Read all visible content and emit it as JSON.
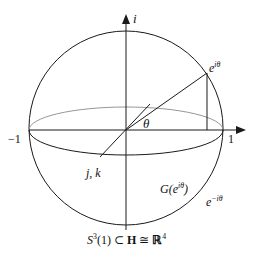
{
  "diagram": {
    "axes": {
      "vertical_label": "i",
      "left_label": "−1",
      "right_label": "1",
      "diagonal_label": "j, k"
    },
    "angle_label": "θ",
    "point_label_base": "e",
    "point_label_exp": "iθ",
    "great_circle_label_base": "G(e",
    "great_circle_label_exp": "iθ",
    "great_circle_label_close": ")",
    "conjugate_label_base": "e",
    "conjugate_label_exp": "−iθ",
    "caption": {
      "s": "S",
      "s_exp": "3",
      "rest1": "(1) ⊂ ",
      "H": "H",
      "rest2": " ≅ ",
      "R": "ℝ",
      "R_exp": "4"
    },
    "colors": {
      "stroke": "#1a1a1a",
      "back_equator": "#8a8a8a"
    }
  }
}
